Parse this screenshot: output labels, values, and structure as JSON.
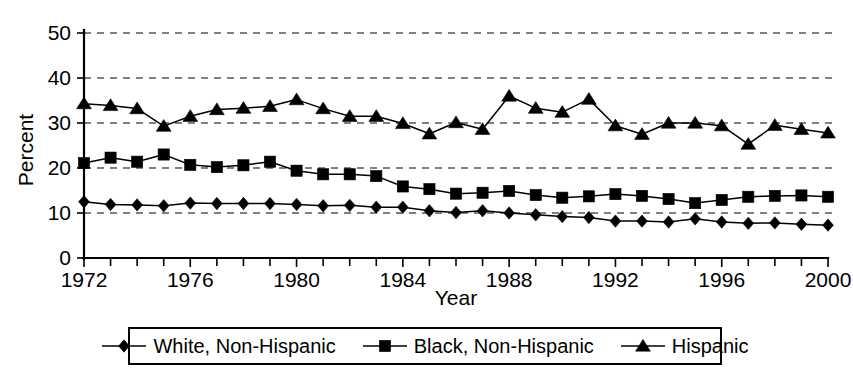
{
  "chart_data": {
    "type": "line",
    "title": "",
    "xlabel": "Year",
    "ylabel": "Percent",
    "xlim": [
      1972,
      2000
    ],
    "ylim": [
      0,
      50
    ],
    "ytick_step": 10,
    "yticks": [
      0,
      10,
      20,
      30,
      40,
      50
    ],
    "xticks_labeled": [
      1972,
      1976,
      1980,
      1984,
      1988,
      1992,
      1996,
      2000
    ],
    "xtick_step_minor": 1,
    "grid": "horizontal-dashed",
    "legend_position": "below",
    "x": [
      1972,
      1973,
      1974,
      1975,
      1976,
      1977,
      1978,
      1979,
      1980,
      1981,
      1982,
      1983,
      1984,
      1985,
      1986,
      1987,
      1988,
      1989,
      1990,
      1991,
      1992,
      1993,
      1994,
      1995,
      1996,
      1997,
      1998,
      1999,
      2000
    ],
    "series": [
      {
        "name": "White, Non-Hispanic",
        "marker": "diamond",
        "values": [
          12.5,
          11.9,
          11.8,
          11.6,
          12.2,
          12.1,
          12.1,
          12.1,
          11.9,
          11.6,
          11.7,
          11.3,
          11.3,
          10.5,
          10.1,
          10.5,
          10.0,
          9.6,
          9.2,
          9.0,
          8.2,
          8.2,
          8.0,
          8.7,
          8.0,
          7.7,
          7.8,
          7.5,
          7.3
        ]
      },
      {
        "name": "Black, Non-Hispanic",
        "marker": "square",
        "values": [
          21.1,
          22.3,
          21.4,
          23.0,
          20.7,
          20.2,
          20.6,
          21.4,
          19.4,
          18.6,
          18.6,
          18.2,
          15.9,
          15.3,
          14.3,
          14.5,
          14.9,
          14.0,
          13.4,
          13.7,
          14.2,
          13.8,
          13.1,
          12.2,
          12.9,
          13.6,
          13.8,
          13.9,
          13.6
        ]
      },
      {
        "name": "Hispanic",
        "marker": "triangle",
        "values": [
          34.3,
          33.9,
          33.2,
          29.3,
          31.5,
          33.0,
          33.3,
          33.7,
          35.2,
          33.2,
          31.5,
          31.5,
          29.9,
          27.6,
          30.1,
          28.6,
          36.0,
          33.3,
          32.4,
          35.3,
          29.4,
          27.5,
          30.0,
          30.0,
          29.4,
          25.3,
          29.5,
          28.6,
          27.8
        ]
      }
    ]
  },
  "axes": {
    "ylabel": "Percent",
    "xlabel": "Year",
    "ytick_labels": [
      "0",
      "10",
      "20",
      "30",
      "40",
      "50"
    ],
    "xtick_labels": [
      "1972",
      "1976",
      "1980",
      "1984",
      "1988",
      "1992",
      "1996",
      "2000"
    ]
  },
  "legend": {
    "entries": [
      {
        "label": "White, Non-Hispanic",
        "marker": "diamond-marker-icon"
      },
      {
        "label": "Black, Non-Hispanic",
        "marker": "square-marker-icon"
      },
      {
        "label": "Hispanic",
        "marker": "triangle-marker-icon"
      }
    ]
  }
}
